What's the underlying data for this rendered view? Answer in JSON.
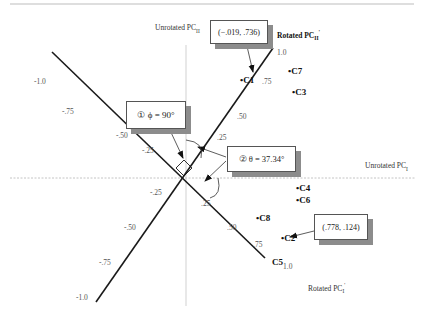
{
  "figure": {
    "type": "factor rotation diagram",
    "unrotated_axes": {
      "horizontal": {
        "label": "Unrotated PC",
        "sub": "I"
      },
      "vertical": {
        "label": "Unrotated PC",
        "sub": "II"
      }
    },
    "rotated_axes": {
      "pc1": {
        "label": "Rotated PC",
        "sub": "I",
        "sup": "'",
        "ticks": [
          "-1.0",
          "-.75",
          "-.50",
          "-.25",
          ".25",
          ".50",
          ".75",
          "1.0"
        ]
      },
      "pc2": {
        "label": "Rotated PC",
        "sub": "II",
        "sup": "'",
        "ticks": [
          "-1.0",
          "-.75",
          "-.50",
          "-.25",
          ".25",
          ".50",
          ".75",
          "1.0"
        ]
      }
    },
    "points": [
      {
        "name": "C1"
      },
      {
        "name": "C7"
      },
      {
        "name": "C3"
      },
      {
        "name": "C4"
      },
      {
        "name": "C6"
      },
      {
        "name": "C8"
      },
      {
        "name": "C2"
      },
      {
        "name": "C5"
      }
    ],
    "callouts": {
      "c1_coords": "(−.019, .736)",
      "c2_coords": "(.778, .124)",
      "phi": {
        "marker": "①",
        "symbol": "ϕ",
        "value": "= 90°"
      },
      "theta": {
        "marker": "②",
        "symbol": "θ",
        "value": "= 37.34°"
      }
    },
    "colors": {
      "axis": "#1a1a1a",
      "guide": "#b0b0b0",
      "shadow": "#8c8c8c"
    }
  }
}
